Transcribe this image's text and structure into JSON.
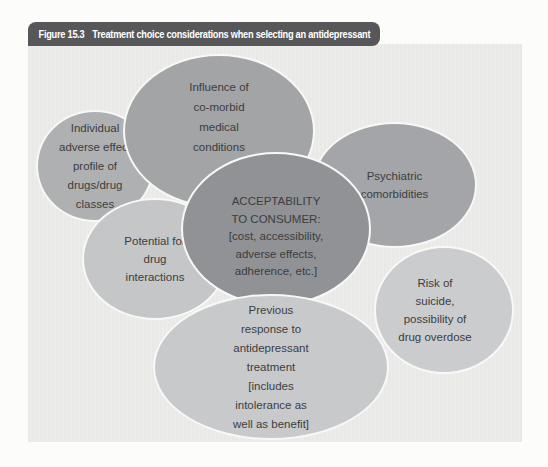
{
  "figure": {
    "label": "Figure 15.3",
    "title": "Treatment choice considerations when selecting an antidepressant"
  },
  "diagram": {
    "ellipses": [
      {
        "id": "individual-adverse-effect-profile",
        "lines": [
          "Individual",
          "adverse effect",
          "profile of",
          "drugs/drug",
          "classes"
        ],
        "fill": "#aeb0b2"
      },
      {
        "id": "influence-comorbid-medical",
        "lines": [
          "Influence of",
          "co-morbid",
          "medical",
          "conditions"
        ],
        "fill": "#a2a4a6"
      },
      {
        "id": "psychiatric-comorbidities",
        "lines": [
          "Psychiatric",
          "comorbidities"
        ],
        "fill": "#a4a5a8"
      },
      {
        "id": "potential-drug-interactions",
        "lines": [
          "Potential for",
          "drug",
          "interactions"
        ],
        "fill": "#c5c6c8"
      },
      {
        "id": "acceptability-to-consumer",
        "lines": [
          "ACCEPTABILITY",
          "TO CONSUMER:",
          "[cost, accessibility,",
          "adverse effects,",
          "adherence, etc.]"
        ],
        "fill": "#909295"
      },
      {
        "id": "risk-of-suicide-overdose",
        "lines": [
          "Risk of",
          "suicide,",
          "possibility of",
          "drug overdose"
        ],
        "fill": "#cbccce"
      },
      {
        "id": "previous-response-treatment",
        "lines": [
          "Previous",
          "response to",
          "antidepressant",
          "treatment",
          "[includes",
          "intolerance as",
          "well as benefit]"
        ],
        "fill": "#c8c9cb"
      }
    ]
  },
  "colors": {
    "title_bar_bg": "#57575a",
    "title_bar_text": "#ffffff",
    "panel_bg": "#e9e9e8",
    "ellipse_outline": "#f8f8f7",
    "ellipse_text": "#3c3d3f"
  }
}
